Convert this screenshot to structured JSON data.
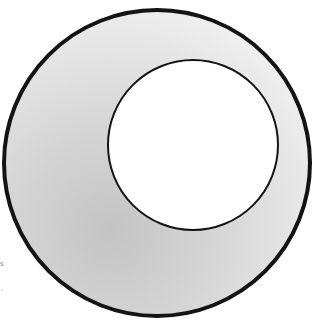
{
  "illustration": {
    "subject": "crescent-shaded ring",
    "colors": {
      "outline": "#141414",
      "shade_dark": "#c4c4c4",
      "shade_mid": "#d6d6d6",
      "shade_light": "#f0f0f0",
      "hole": "#ffffff",
      "background": "#ffffff"
    }
  },
  "edge_marks": [
    "s",
    "-"
  ]
}
